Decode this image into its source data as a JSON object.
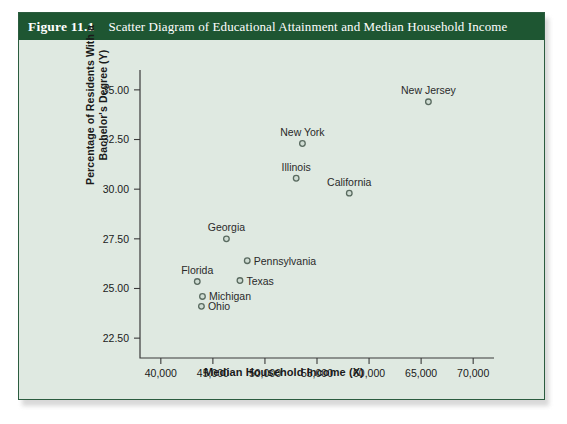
{
  "figure": {
    "number": "Figure 11.1",
    "title": "Scatter Diagram of Educational Attainment and Median Household Income",
    "header_bg": "#1e5632",
    "panel_bg": "#dfe9e1",
    "border_color": "#2b5c3f"
  },
  "chart_data": {
    "type": "scatter",
    "title": "Scatter Diagram of Educational Attainment and Median Household Income",
    "xlabel": "Median Household Income (X)",
    "ylabel": "Percentage of Residents With a Bachelor's Degree (Y)",
    "xlim": [
      38000,
      72000
    ],
    "ylim": [
      21.5,
      36.0
    ],
    "xticks": [
      40000,
      45000,
      50000,
      55000,
      60000,
      65000,
      70000
    ],
    "xtick_labels": [
      "40,000",
      "45,000",
      "50,000",
      "55,000",
      "60,000",
      "65,000",
      "70,000"
    ],
    "yticks": [
      22.5,
      25.0,
      27.5,
      30.0,
      32.5,
      35.0
    ],
    "ytick_labels": [
      "22.50",
      "25.00",
      "27.50",
      "30.00",
      "32.50",
      "35.00"
    ],
    "grid": false,
    "legend": "none",
    "marker_style": "open-circle",
    "marker_fill": "#cfdcd3",
    "marker_stroke": "#5a6b60",
    "points": [
      {
        "label": "New Jersey",
        "x": 65700,
        "y": 34.4,
        "label_pos": "above"
      },
      {
        "label": "New York",
        "x": 53600,
        "y": 32.3,
        "label_pos": "above"
      },
      {
        "label": "Illinois",
        "x": 53000,
        "y": 30.55,
        "label_pos": "above"
      },
      {
        "label": "California",
        "x": 58100,
        "y": 29.8,
        "label_pos": "above"
      },
      {
        "label": "Georgia",
        "x": 46300,
        "y": 27.5,
        "label_pos": "above"
      },
      {
        "label": "Pennsylvania",
        "x": 48300,
        "y": 26.4,
        "label_pos": "right"
      },
      {
        "label": "Texas",
        "x": 47600,
        "y": 25.4,
        "label_pos": "right"
      },
      {
        "label": "Florida",
        "x": 43500,
        "y": 25.35,
        "label_pos": "above"
      },
      {
        "label": "Michigan",
        "x": 44000,
        "y": 24.6,
        "label_pos": "right"
      },
      {
        "label": "Ohio",
        "x": 43900,
        "y": 24.1,
        "label_pos": "right"
      }
    ]
  }
}
